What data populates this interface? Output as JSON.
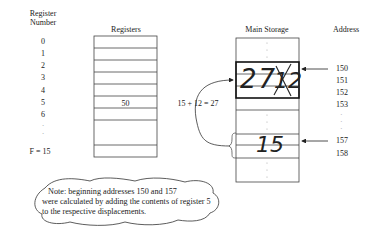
{
  "headers": {
    "register_number": [
      "Register",
      "Number"
    ],
    "registers": "Registers",
    "main_storage": "Main Storage",
    "address": "Address"
  },
  "register_numbers": [
    "0",
    "1",
    "2",
    "3",
    "4",
    "5",
    "6",
    "·",
    "·",
    "F = 15"
  ],
  "registers": {
    "rows": 10,
    "values": {
      "5": "50"
    }
  },
  "main_storage": {
    "handwritten_top": "27",
    "crossed_out": "12",
    "handwritten_bottom": "15"
  },
  "addresses": [
    "150",
    "151",
    "152",
    "153",
    "·",
    "·",
    "·",
    "157",
    "158"
  ],
  "calculation": "15 + 12 = 27",
  "note": {
    "lines": [
      "Note: beginning addresses 150 and 157",
      "were calculated by adding the contents of register 5",
      "to the respective displacements."
    ]
  },
  "colors": {
    "line": "#333333",
    "text": "#222222",
    "background": "#ffffff"
  }
}
